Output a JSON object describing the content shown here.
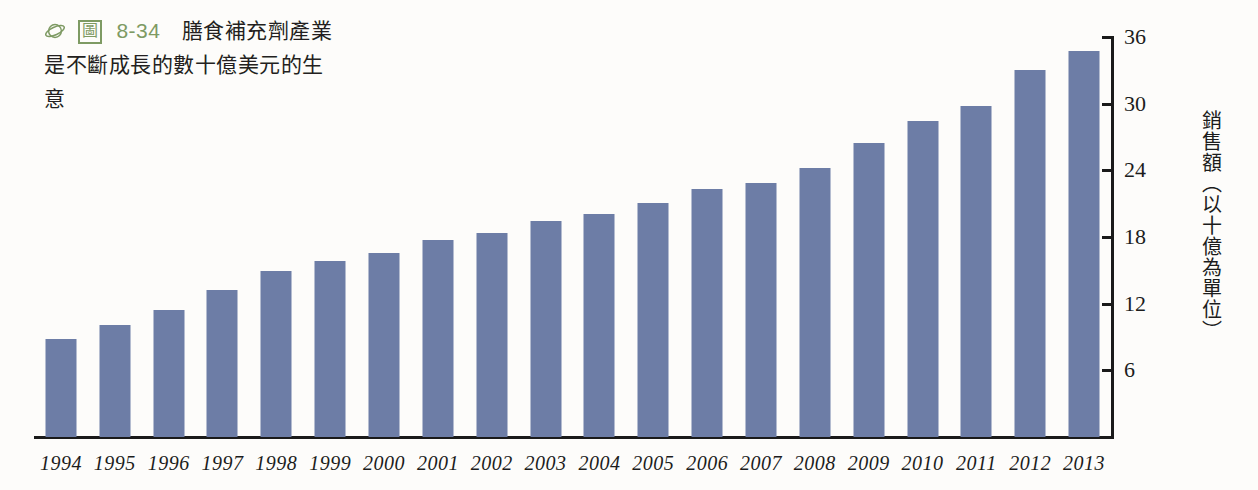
{
  "caption": {
    "icon_name": "green-planet-icon",
    "figure_box_label": "圖",
    "figure_number": "8-34",
    "line1": "膳食補充劑產業",
    "line2": "是不斷成長的數十億美元的生",
    "line3": "意",
    "accent_color": "#7e9a63"
  },
  "chart_data": {
    "type": "bar",
    "title": "",
    "xlabel": "",
    "ylabel": "銷售額（以十億為單位）",
    "ylim": [
      0,
      36
    ],
    "yticks": [
      6,
      12,
      18,
      24,
      30,
      36
    ],
    "grid": false,
    "legend": "none",
    "bar_color": "#6d7da6",
    "axis_color": "#1a1a1a",
    "categories": [
      "1994",
      "1995",
      "1996",
      "1997",
      "1998",
      "1999",
      "2000",
      "2001",
      "2002",
      "2003",
      "2004",
      "2005",
      "2006",
      "2007",
      "2008",
      "2009",
      "2010",
      "2011",
      "2012",
      "2013"
    ],
    "values": [
      8.8,
      10.1,
      11.4,
      13.2,
      14.9,
      15.8,
      16.6,
      17.7,
      18.4,
      19.4,
      20.1,
      21.1,
      22.3,
      22.9,
      24.2,
      26.5,
      28.4,
      29.8,
      33.0,
      34.7
    ]
  }
}
